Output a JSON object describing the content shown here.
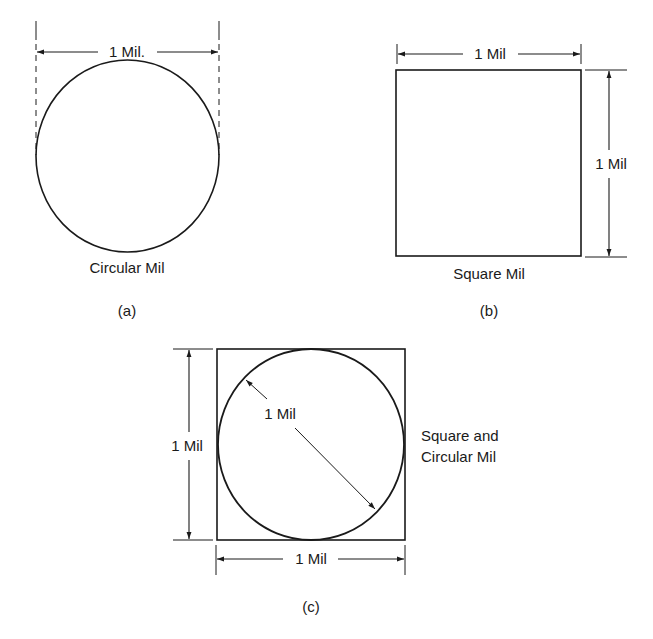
{
  "figure_a": {
    "dimension_label": "1 Mil.",
    "shape_label": "Circular Mil",
    "caption": "(a)"
  },
  "figure_b": {
    "top_dimension_label": "1 Mil",
    "side_dimension_label": "1 Mil",
    "shape_label": "Square Mil",
    "caption": "(b)"
  },
  "figure_c": {
    "left_dimension_label": "1 Mil",
    "bottom_dimension_label": "1 Mil",
    "diameter_label": "1 Mil",
    "shape_label_line1": "Square and",
    "shape_label_line2": "Circular Mil",
    "caption": "(c)"
  },
  "colors": {
    "ink": "#1a1a1a",
    "background": "#ffffff"
  }
}
